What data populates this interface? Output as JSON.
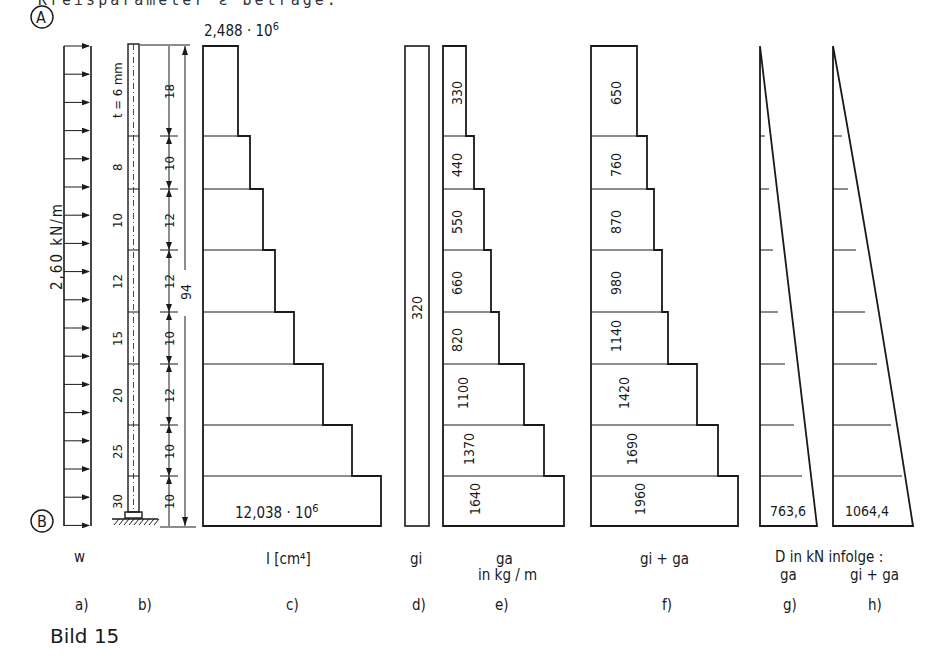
{
  "header": {
    "cut_text": "Kreisparameter ε betrage:"
  },
  "figure": {
    "title": "Bild 15",
    "points": {
      "top": "A",
      "bottom": "B"
    },
    "load": {
      "value_label": "2,60 kN/m",
      "symbol": "w"
    },
    "column": {
      "thickness_label": "t = 6 mm",
      "segment_thicknesses": [
        "8",
        "10",
        "12",
        "15",
        "20",
        "25",
        "30"
      ],
      "segment_lengths": [
        "18",
        "10",
        "12",
        "12",
        "10",
        "12",
        "10",
        "10"
      ],
      "total_length": "94"
    },
    "inertia": {
      "top_label": "2,488 · 10",
      "top_exp": "6",
      "bottom_label": "12,038 · 10",
      "bottom_exp": "6",
      "caption": "I [cm⁴]"
    },
    "gi": {
      "value": "320",
      "caption": "gi"
    },
    "ga": {
      "values": [
        "330",
        "440",
        "550",
        "660",
        "820",
        "1100",
        "1370",
        "1640"
      ],
      "caption": "ga",
      "unit": "in kg / m"
    },
    "gi_ga": {
      "values": [
        "650",
        "760",
        "870",
        "980",
        "1140",
        "1420",
        "1690",
        "1960"
      ],
      "caption": "gi + ga"
    },
    "axial": {
      "heading": "D in kN  infolge :",
      "g_value": "763,6",
      "g_caption": "ga",
      "h_value": "1064,4",
      "h_caption": "gi + ga"
    },
    "subfig_labels": [
      "a)",
      "b)",
      "c)",
      "d)",
      "e)",
      "f)",
      "g)",
      "h)"
    ]
  },
  "chart_data": {
    "type": "table",
    "title": "Bild 15",
    "segments_from_top": [
      1,
      2,
      3,
      4,
      5,
      6,
      7,
      8
    ],
    "segment_length": [
      18,
      10,
      12,
      12,
      10,
      12,
      10,
      10
    ],
    "total_length": 94,
    "wall_thickness_mm": [
      6,
      8,
      10,
      12,
      15,
      20,
      25,
      30
    ],
    "wind_load_kN_per_m": 2.6,
    "I_cm4_top": 2488000,
    "I_cm4_bottom": 12038000,
    "gi_kg_per_m": 320,
    "ga_kg_per_m": [
      330,
      440,
      550,
      660,
      820,
      1100,
      1370,
      1640
    ],
    "gi_plus_ga_kg_per_m": [
      650,
      760,
      870,
      980,
      1140,
      1420,
      1690,
      1960
    ],
    "D_kN_bottom_due_to_ga": 763.6,
    "D_kN_bottom_due_to_gi_plus_ga": 1064.4
  }
}
